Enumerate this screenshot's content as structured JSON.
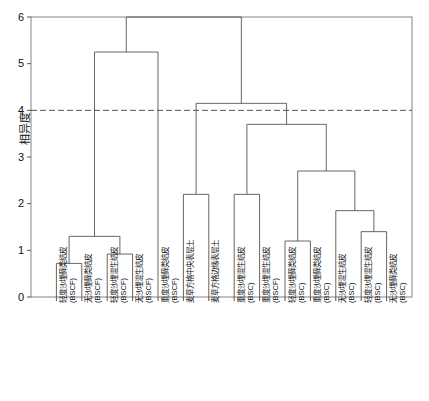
{
  "chart_data": {
    "type": "dendrogram",
    "title": "",
    "xlabel": "",
    "ylabel": "相异度",
    "ylim": [
      0,
      6
    ],
    "yticks": [
      0,
      1,
      2,
      3,
      4,
      5,
      6
    ],
    "grid": false,
    "legend": "none",
    "cut_line": {
      "value": 4.0,
      "style": "dashed",
      "color": "#555555"
    },
    "line_color": "#555555",
    "background": "#ffffff",
    "n_leaves": 14,
    "leaf_labels": [
      "轻度沙埋藓类结皮 (BSCF)",
      "无沙埋藓类结皮 (BSCF)",
      "轻度沙埋混生结皮 (BSCF)",
      "无沙埋混生结皮 (BSCF)",
      "重度沙埋藓类结皮 (BSCF)",
      "麦草方格中央表层土",
      "麦草方格边缘表层土",
      "重度沙埋混生结皮 (BSC)",
      "重度沙埋混生结皮 (BSCF)",
      "轻度沙埋藓类结皮 (BSC)",
      "重度沙埋藓类结皮 (BSC)",
      "无沙埋混生结皮 (BSC)",
      "轻度沙埋混生结皮 (BSC)",
      "无沙埋藓类结皮 (BSC)"
    ],
    "leaf_labels_line1": [
      "轻度沙埋藓类结皮",
      "无沙埋藓类结皮",
      "轻度沙埋混生结皮",
      "无沙埋混生结皮",
      "重度沙埋藓类结皮",
      "麦草方格中央表层土",
      "麦草方格边缘表层土",
      "重度沙埋混生结皮",
      "重度沙埋混生结皮",
      "轻度沙埋藓类结皮",
      "重度沙埋藓类结皮",
      "无沙埋混生结皮",
      "轻度沙埋混生结皮",
      "无沙埋藓类结皮"
    ],
    "leaf_labels_line2": [
      "(BSCF)",
      "(BSCF)",
      "(BSCF)",
      "(BSCF)",
      "(BSCF)",
      "",
      "",
      "(BSC)",
      "(BSCF)",
      "(BSC)",
      "(BSC)",
      "(BSC)",
      "(BSC)",
      "(BSC)"
    ],
    "merges": [
      {
        "id": "m1",
        "left": "leaf0",
        "right": "leaf1",
        "height": 0.72
      },
      {
        "id": "m2",
        "left": "leaf2",
        "right": "leaf3",
        "height": 0.92
      },
      {
        "id": "m3",
        "left": "m1",
        "right": "m2",
        "height": 1.3
      },
      {
        "id": "m4",
        "left": "leaf5",
        "right": "leaf6",
        "height": 2.2
      },
      {
        "id": "m5",
        "left": "leaf7",
        "right": "leaf8",
        "height": 2.2
      },
      {
        "id": "m6",
        "left": "leaf9",
        "right": "leaf10",
        "height": 1.2
      },
      {
        "id": "m7",
        "left": "leaf12",
        "right": "leaf13",
        "height": 1.4
      },
      {
        "id": "m8",
        "left": "leaf11",
        "right": "m7",
        "height": 1.85
      },
      {
        "id": "m9",
        "left": "m6",
        "right": "m8",
        "height": 2.7
      },
      {
        "id": "m10",
        "left": "m5",
        "right": "m9",
        "height": 3.7
      },
      {
        "id": "m11",
        "left": "m4",
        "right": "m10",
        "height": 4.15
      },
      {
        "id": "m12",
        "left": "m3",
        "right": "leaf4",
        "height": 5.25
      },
      {
        "id": "root",
        "left": "m12",
        "right": "m11",
        "height": 6.0
      }
    ]
  }
}
